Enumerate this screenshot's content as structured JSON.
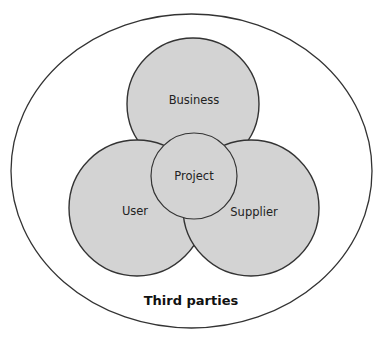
{
  "diagram": {
    "type": "venn",
    "outer": {
      "label": "Third parties",
      "cx": 191.5,
      "cy": 171,
      "rx": 180.5,
      "ry": 157
    },
    "circles": [
      {
        "id": "business",
        "label": "Business",
        "cx": 193,
        "cy": 104,
        "r": 66,
        "label_x": 194,
        "label_y": 104
      },
      {
        "id": "user",
        "label": "User",
        "cx": 137,
        "cy": 208,
        "r": 68,
        "label_x": 135,
        "label_y": 215
      },
      {
        "id": "supplier",
        "label": "Supplier",
        "cx": 251,
        "cy": 208,
        "r": 68,
        "label_x": 254,
        "label_y": 216
      },
      {
        "id": "project",
        "label": "Project",
        "cx": 194,
        "cy": 176,
        "r": 43,
        "label_x": 194,
        "label_y": 180
      }
    ],
    "colors": {
      "fill": "#d3d3d3",
      "stroke": "#333333",
      "outer_stroke": "#333333",
      "background": "#ffffff"
    }
  }
}
